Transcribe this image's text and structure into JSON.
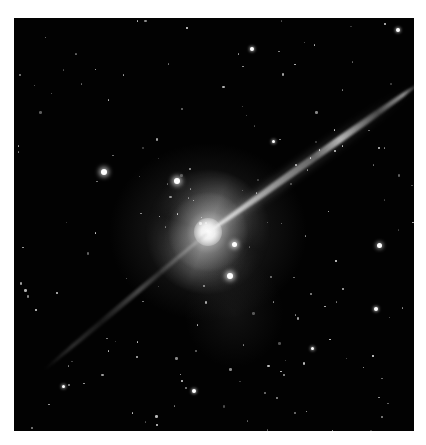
{
  "image": {
    "subject": "spiral galaxy with bipolar jet",
    "description": "Grayscale astronomical image: face-on spiral galaxy near center with a long bright jet extending to the upper right and a fainter counter-jet to the lower left, on a black star field.",
    "background_color": "#020202",
    "page_color": "#ffffff"
  },
  "galaxy": {
    "cx": 194,
    "cy": 214,
    "core_color": "#ffffff",
    "arm_color": "#9a9a9a"
  },
  "jets": [
    {
      "name": "upper-right-jet",
      "x1": 194,
      "y1": 214,
      "x2": 405,
      "y2": 65,
      "brightness": 0.75
    },
    {
      "name": "lower-left-jet",
      "x1": 194,
      "y1": 214,
      "x2": 25,
      "y2": 355,
      "brightness": 0.35
    }
  ],
  "bright_stars": [
    {
      "x": 90,
      "y": 154,
      "r": 3
    },
    {
      "x": 163,
      "y": 163,
      "r": 3
    },
    {
      "x": 216,
      "y": 258,
      "r": 3
    },
    {
      "x": 221,
      "y": 227,
      "r": 2.5
    },
    {
      "x": 366,
      "y": 228,
      "r": 2.5
    },
    {
      "x": 180,
      "y": 373,
      "r": 2
    },
    {
      "x": 362,
      "y": 291,
      "r": 2
    },
    {
      "x": 384,
      "y": 12,
      "r": 2
    }
  ]
}
